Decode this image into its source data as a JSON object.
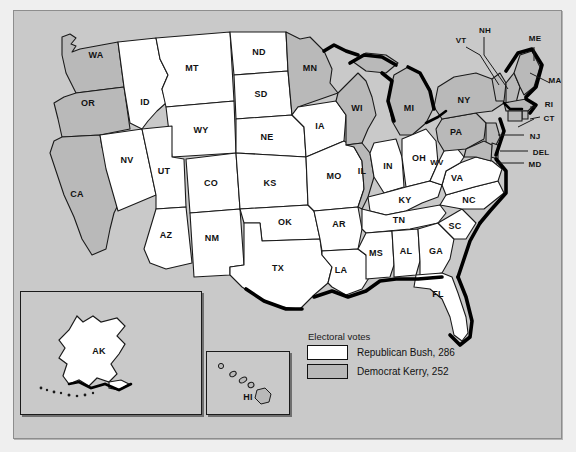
{
  "map": {
    "title": "2004 United States Presidential Election Electoral Map",
    "colors": {
      "republican_fill": "#ffffff",
      "democrat_fill": "#b9b9b9",
      "ocean_background": "#c9c9c9",
      "border": "#1a1a1a",
      "coastline_shadow": "#000000"
    }
  },
  "legend": {
    "title": "Electoral votes",
    "entries": [
      {
        "label": "Republican Bush, 286",
        "party": "Republican",
        "candidate": "Bush",
        "votes": 286,
        "swatch": "white"
      },
      {
        "label": "Democrat Kerry, 252",
        "party": "Democrat",
        "candidate": "Kerry",
        "votes": 252,
        "swatch": "gray"
      }
    ]
  },
  "insets": {
    "alaska": {
      "label": "AK",
      "winner": "Republican"
    },
    "hawaii": {
      "label": "HI",
      "winner": "Democrat"
    }
  },
  "states": [
    {
      "code": "WA",
      "winner": "Democrat"
    },
    {
      "code": "OR",
      "winner": "Democrat"
    },
    {
      "code": "CA",
      "winner": "Democrat"
    },
    {
      "code": "NV",
      "winner": "Republican"
    },
    {
      "code": "ID",
      "winner": "Republican"
    },
    {
      "code": "MT",
      "winner": "Republican"
    },
    {
      "code": "WY",
      "winner": "Republican"
    },
    {
      "code": "UT",
      "winner": "Republican"
    },
    {
      "code": "CO",
      "winner": "Republican"
    },
    {
      "code": "AZ",
      "winner": "Republican"
    },
    {
      "code": "NM",
      "winner": "Republican"
    },
    {
      "code": "ND",
      "winner": "Republican"
    },
    {
      "code": "SD",
      "winner": "Republican"
    },
    {
      "code": "NE",
      "winner": "Republican"
    },
    {
      "code": "KS",
      "winner": "Republican"
    },
    {
      "code": "OK",
      "winner": "Republican"
    },
    {
      "code": "TX",
      "winner": "Republican"
    },
    {
      "code": "MN",
      "winner": "Democrat"
    },
    {
      "code": "IA",
      "winner": "Republican"
    },
    {
      "code": "MO",
      "winner": "Republican"
    },
    {
      "code": "AR",
      "winner": "Republican"
    },
    {
      "code": "LA",
      "winner": "Republican"
    },
    {
      "code": "WI",
      "winner": "Democrat"
    },
    {
      "code": "IL",
      "winner": "Democrat"
    },
    {
      "code": "MI",
      "winner": "Democrat"
    },
    {
      "code": "IN",
      "winner": "Republican"
    },
    {
      "code": "OH",
      "winner": "Republican"
    },
    {
      "code": "KY",
      "winner": "Republican"
    },
    {
      "code": "TN",
      "winner": "Republican"
    },
    {
      "code": "MS",
      "winner": "Republican"
    },
    {
      "code": "AL",
      "winner": "Republican"
    },
    {
      "code": "GA",
      "winner": "Republican"
    },
    {
      "code": "FL",
      "winner": "Republican"
    },
    {
      "code": "SC",
      "winner": "Republican"
    },
    {
      "code": "NC",
      "winner": "Republican"
    },
    {
      "code": "VA",
      "winner": "Republican"
    },
    {
      "code": "WV",
      "winner": "Republican"
    },
    {
      "code": "PA",
      "winner": "Democrat"
    },
    {
      "code": "NY",
      "winner": "Democrat"
    },
    {
      "code": "VT",
      "winner": "Democrat"
    },
    {
      "code": "NH",
      "winner": "Democrat"
    },
    {
      "code": "ME",
      "winner": "Democrat"
    },
    {
      "code": "MA",
      "winner": "Democrat"
    },
    {
      "code": "RI",
      "winner": "Democrat"
    },
    {
      "code": "CT",
      "winner": "Democrat"
    },
    {
      "code": "NJ",
      "winner": "Democrat"
    },
    {
      "code": "DEL",
      "winner": "Democrat"
    },
    {
      "code": "MD",
      "winner": "Democrat"
    }
  ],
  "labels": {
    "WA": "WA",
    "OR": "OR",
    "CA": "CA",
    "NV": "NV",
    "ID": "ID",
    "MT": "MT",
    "WY": "WY",
    "UT": "UT",
    "CO": "CO",
    "AZ": "AZ",
    "NM": "NM",
    "ND": "ND",
    "SD": "SD",
    "NE": "NE",
    "KS": "KS",
    "OK": "OK",
    "TX": "TX",
    "MN": "MN",
    "IA": "IA",
    "MO": "MO",
    "AR": "AR",
    "LA": "LA",
    "WI": "WI",
    "IL": "IL",
    "MI": "MI",
    "IN": "IN",
    "OH": "OH",
    "KY": "KY",
    "TN": "TN",
    "MS": "MS",
    "AL": "AL",
    "GA": "GA",
    "FL": "FL",
    "SC": "SC",
    "NC": "NC",
    "VA": "VA",
    "WV": "WV",
    "PA": "PA",
    "NY": "NY",
    "VT": "VT",
    "NH": "NH",
    "ME": "ME",
    "MA": "MA",
    "RI": "RI",
    "CT": "CT",
    "NJ": "NJ",
    "DEL": "DEL",
    "MD": "MD",
    "AK": "AK",
    "HI": "HI"
  }
}
